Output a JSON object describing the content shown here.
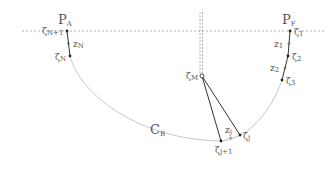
{
  "diagram": {
    "title": "",
    "colors": {
      "curve": "#c8c8c8",
      "segment": "#333333",
      "dashed": "#9a9a9a",
      "text": "#555555"
    },
    "labels": {
      "p_a": {
        "main": "P",
        "sub": "A"
      },
      "p_f": {
        "main": "P",
        "sub": "F"
      },
      "c_b": {
        "main": "C",
        "sub": "B"
      },
      "zeta_n1": {
        "main": "ζ",
        "sub": "N+1"
      },
      "zeta_n": {
        "main": "ζ",
        "sub": "N"
      },
      "z_n": {
        "main": "z",
        "sub": "N"
      },
      "zeta_1": {
        "main": "ζ",
        "sub": "1"
      },
      "zeta_2": {
        "main": "ζ",
        "sub": "2"
      },
      "zeta_3": {
        "main": "ζ",
        "sub": "3"
      },
      "z_1": {
        "main": "z",
        "sub": "1"
      },
      "z_2": {
        "main": "z",
        "sub": "2"
      },
      "zeta_m": {
        "main": "ζ",
        "sub": "M"
      },
      "zeta_j": {
        "main": "ζ",
        "sub": "j"
      },
      "zeta_j1": {
        "main": "ζ",
        "sub": "j+1"
      },
      "z_j": {
        "main": "z",
        "sub": "j"
      }
    }
  }
}
